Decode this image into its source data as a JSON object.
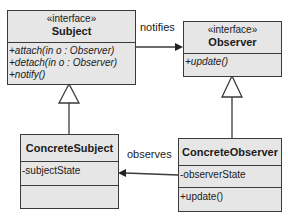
{
  "diagram": {
    "type": "UML class diagram",
    "classes": {
      "subject": {
        "stereotype": "«interface»",
        "name": "Subject",
        "operations": [
          "+attach(in o : Observer)",
          "+detach(in o : Observer)",
          "+notify()"
        ]
      },
      "observer": {
        "stereotype": "«interface»",
        "name": "Observer",
        "operations": [
          "+update()"
        ]
      },
      "concrete_subject": {
        "name": "ConcreteSubject",
        "attributes": [
          "-subjectState"
        ],
        "operations": []
      },
      "concrete_observer": {
        "name": "ConcreteObserver",
        "attributes": [
          "-observerState"
        ],
        "operations": [
          "+update()"
        ]
      }
    },
    "relations": {
      "notifies": {
        "label": "notifies",
        "from": "Subject",
        "to": "Observer",
        "kind": "association"
      },
      "observes": {
        "label": "observes",
        "from": "ConcreteObserver",
        "to": "ConcreteSubject",
        "kind": "association"
      },
      "subject_realization": {
        "from": "ConcreteSubject",
        "to": "Subject",
        "kind": "generalization"
      },
      "observer_realization": {
        "from": "ConcreteObserver",
        "to": "Observer",
        "kind": "generalization"
      }
    },
    "colors": {
      "box_fill": "#e6e6e6",
      "line": "#3a3a3a",
      "background": "#ffffff"
    }
  }
}
